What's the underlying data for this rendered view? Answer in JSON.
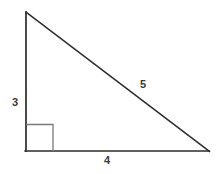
{
  "figure": {
    "name": "right-triangle",
    "background_color": "#ffffff",
    "stroke_color": "#2b2b2b",
    "right_angle_color": "#7a7a7a",
    "label_color": "#3a3a3a"
  },
  "vertices": {
    "apex": {
      "x": 26,
      "y": 12
    },
    "bottom_left": {
      "x": 26,
      "y": 151
    },
    "bottom_right": {
      "x": 209,
      "y": 151
    }
  },
  "right_angle_marker": {
    "name": "right-angle-square",
    "x": 26,
    "y": 124,
    "size": 27,
    "degrees": 90
  },
  "labels": {
    "leg_vertical": "3",
    "leg_horizontal": "4",
    "hypotenuse": "5"
  },
  "geometry": {
    "vertical_leg_length": 3,
    "horizontal_leg_length": 4,
    "hypotenuse_length": 5
  }
}
